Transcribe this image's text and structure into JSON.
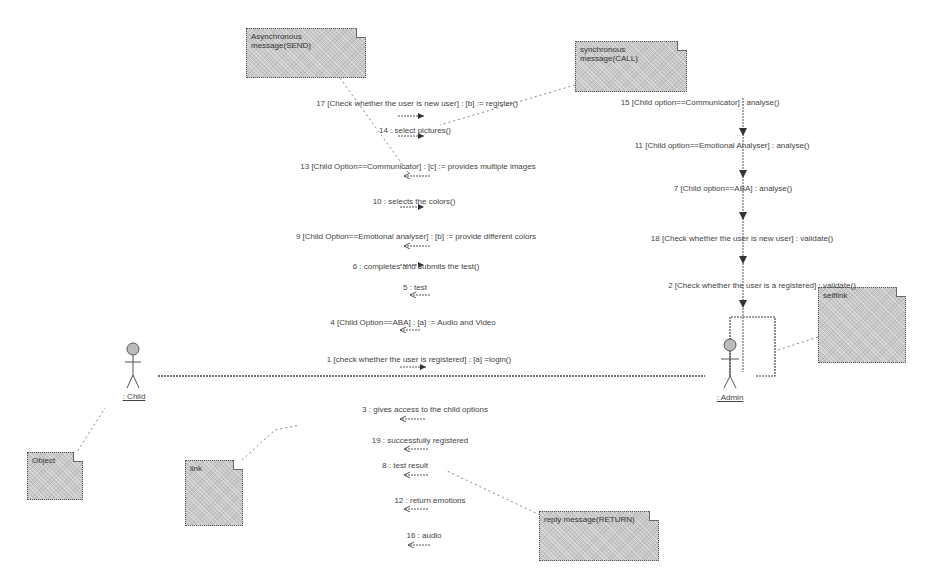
{
  "diagram": {
    "type": "UML communication diagram",
    "actors": [
      {
        "id": "child",
        "label": ": Child"
      },
      {
        "id": "admin",
        "label": ": Admin"
      }
    ],
    "notes": {
      "async": "Asynchronous message(SEND)",
      "sync": "synchronous message(CALL)",
      "selflink": "selflink",
      "object": "Object",
      "link": "link",
      "reply": "reply message(RETURN)"
    },
    "messages_child_to_admin": [
      "17 [Check whether the user is new user] : [b] := register()",
      "14 : select pictures()",
      "13 [Child Option==Communicator] : [c] := provides multiple images",
      "10 : selects the colors()",
      "9 [Child Option==Emotional analyser] : [b] := provide different colors",
      "6 : completes and submits the test()",
      "5 : test",
      "4 [Child Option==ABA] : [a] := Audio and Video",
      "1 [check whether the user is registered] : [a] =login()"
    ],
    "messages_admin_to_child": [
      "3 : gives access to the child options",
      "19 : successfully registered",
      "8 : test result",
      "12 : return emotions",
      "16 : audio"
    ],
    "messages_self": [
      "15 [Child option==Communicator] : analyse()",
      "11 [Child option==Emotional Analyser] : analyse()",
      "7 [Child option==ABA] : analyse()",
      "18 [Check whether the user is new user] : validate()",
      "2 [Check whether the user is a registered] : validate()"
    ]
  }
}
